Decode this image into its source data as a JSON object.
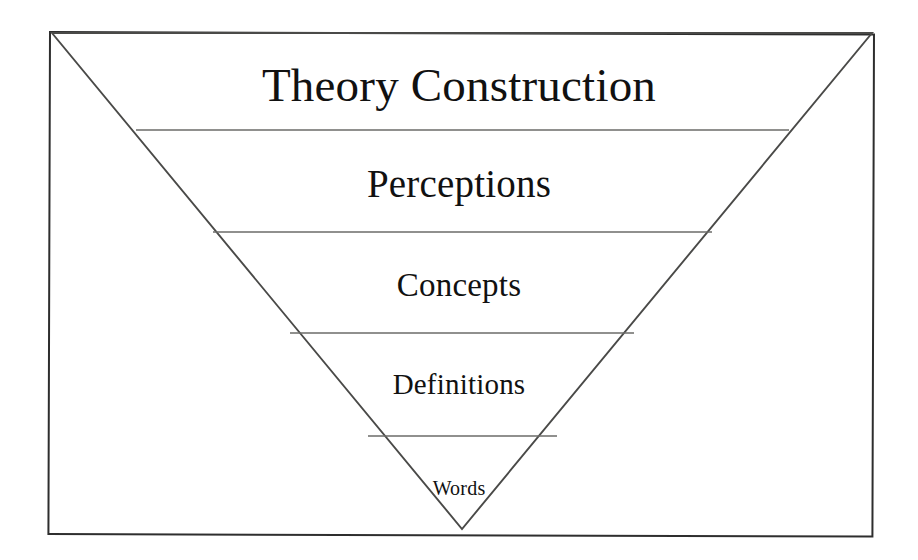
{
  "diagram": {
    "title": "Theory Construction",
    "shape": "inverted-triangle",
    "orientation": "widest at top, apex at bottom",
    "frame": {
      "border_color": "#2e2e2e",
      "background_color": "#ffffff"
    },
    "outline_color": "#4a4a48",
    "divider_color": "#6b6b68",
    "text_color": "#111111",
    "levels": [
      {
        "index": 1,
        "label": "Theory Construction",
        "font_size_px": 47,
        "center_x": 462,
        "center_y": 86,
        "band_top_y": 33,
        "band_bottom_y": 130
      },
      {
        "index": 2,
        "label": "Perceptions",
        "font_size_px": 39,
        "center_x": 462,
        "center_y": 184,
        "band_top_y": 130,
        "band_bottom_y": 232
      },
      {
        "index": 3,
        "label": "Concepts",
        "font_size_px": 33,
        "center_x": 462,
        "center_y": 286,
        "band_top_y": 232,
        "band_bottom_y": 333
      },
      {
        "index": 4,
        "label": "Definitions",
        "font_size_px": 29,
        "center_x": 462,
        "center_y": 385,
        "band_top_y": 333,
        "band_bottom_y": 436
      },
      {
        "index": 5,
        "label": "Words",
        "font_size_px": 20,
        "center_x": 462,
        "center_y": 488,
        "band_top_y": 436,
        "band_bottom_y": 529
      }
    ],
    "geometry": {
      "apex_x": 462,
      "apex_y": 529,
      "top_left_x": 52,
      "top_left_y": 33,
      "top_right_x": 872,
      "top_right_y": 33,
      "dividers": [
        {
          "y": 130,
          "x1": 136,
          "x2": 789
        },
        {
          "y": 232,
          "x1": 213,
          "x2": 712
        },
        {
          "y": 333,
          "x1": 290,
          "x2": 634
        },
        {
          "y": 436,
          "x1": 368,
          "x2": 557
        }
      ]
    }
  }
}
